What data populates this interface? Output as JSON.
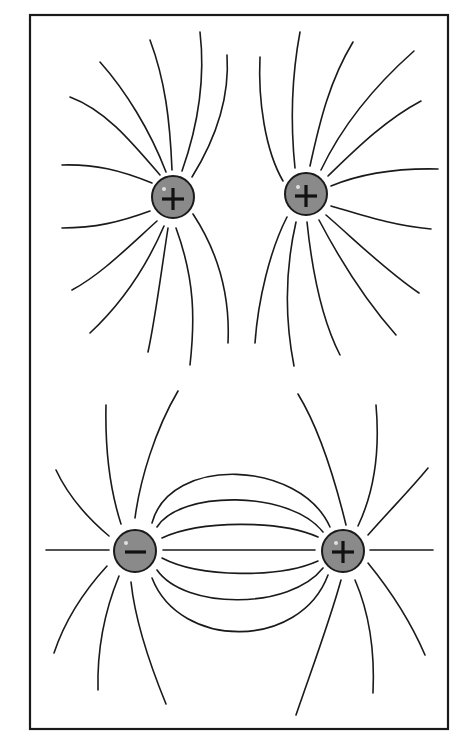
{
  "diagram": {
    "frame": {
      "x": 29,
      "y": 14,
      "width": 419,
      "height": 715,
      "stroke": "#1a1a1a"
    },
    "charge_color": "#8a8a8a",
    "panels": [
      {
        "name": "like-charges",
        "description": "Two positive charges repelling",
        "charges": [
          {
            "sign": "+",
            "label": "+",
            "x": 173,
            "y": 197,
            "r": 21
          },
          {
            "sign": "+",
            "label": "+",
            "x": 306,
            "y": 194,
            "r": 21
          }
        ]
      },
      {
        "name": "opposite-charges",
        "description": "Negative and positive charge (dipole)",
        "charges": [
          {
            "sign": "-",
            "label": "−",
            "x": 135,
            "y": 551,
            "r": 21
          },
          {
            "sign": "+",
            "label": "+",
            "x": 343,
            "y": 551,
            "r": 21
          }
        ]
      }
    ]
  }
}
